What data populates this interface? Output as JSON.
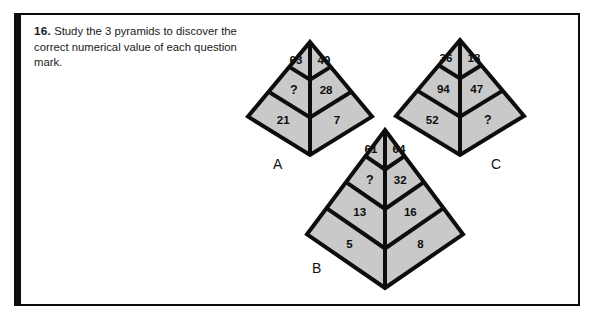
{
  "question": {
    "number": "16.",
    "text": "Study the 3 pyramids to discover the correct numerical value of each question mark."
  },
  "colors": {
    "ink": "#0d0d0d",
    "fill": "#c9c9c9",
    "page": "#ffffff"
  },
  "pyramids": [
    {
      "label": "A",
      "rows": 3,
      "geometry": {
        "apex_x": 310,
        "apex_y": 42,
        "bottom_y": 155,
        "half_width": 62
      },
      "label_pos": {
        "x": 273,
        "y": 156
      },
      "cells": [
        {
          "row": 1,
          "side": "left",
          "value": "63"
        },
        {
          "row": 1,
          "side": "right",
          "value": "49"
        },
        {
          "row": 2,
          "side": "left",
          "value": "?"
        },
        {
          "row": 2,
          "side": "right",
          "value": "28"
        },
        {
          "row": 3,
          "side": "left",
          "value": "21"
        },
        {
          "row": 3,
          "side": "right",
          "value": "7"
        }
      ]
    },
    {
      "label": "B",
      "rows": 4,
      "geometry": {
        "apex_x": 385,
        "apex_y": 130,
        "bottom_y": 288,
        "half_width": 78
      },
      "label_pos": {
        "x": 312,
        "y": 260
      },
      "cells": [
        {
          "row": 1,
          "side": "left",
          "value": "61"
        },
        {
          "row": 1,
          "side": "right",
          "value": "64"
        },
        {
          "row": 2,
          "side": "left",
          "value": "?"
        },
        {
          "row": 2,
          "side": "right",
          "value": "32"
        },
        {
          "row": 3,
          "side": "left",
          "value": "13"
        },
        {
          "row": 3,
          "side": "right",
          "value": "16"
        },
        {
          "row": 4,
          "side": "left",
          "value": "5"
        },
        {
          "row": 4,
          "side": "right",
          "value": "8"
        }
      ]
    },
    {
      "label": "C",
      "rows": 3,
      "geometry": {
        "apex_x": 460,
        "apex_y": 40,
        "bottom_y": 155,
        "half_width": 64
      },
      "label_pos": {
        "x": 491,
        "y": 156
      },
      "cells": [
        {
          "row": 1,
          "side": "left",
          "value": "36"
        },
        {
          "row": 1,
          "side": "right",
          "value": "18"
        },
        {
          "row": 2,
          "side": "left",
          "value": "94"
        },
        {
          "row": 2,
          "side": "right",
          "value": "47"
        },
        {
          "row": 3,
          "side": "left",
          "value": "52"
        },
        {
          "row": 3,
          "side": "right",
          "value": "?"
        }
      ]
    }
  ]
}
